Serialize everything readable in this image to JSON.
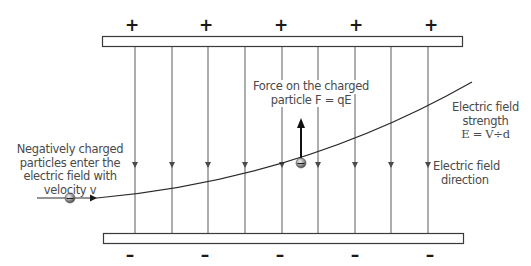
{
  "diagram": {
    "top_plate": {
      "charge_sign": "+",
      "sign_positions_x": [
        132,
        205,
        281,
        355,
        431
      ]
    },
    "bottom_plate": {
      "charge_sign": "–",
      "sign_positions_x": [
        130,
        205,
        280,
        355,
        430
      ]
    },
    "field_line_x": [
      135,
      172,
      208,
      245,
      282,
      318,
      355,
      391,
      428
    ],
    "colors": {
      "stroke": "#3a3a3a",
      "field_line": "#6a6a6a",
      "text": "#4a4a4a",
      "plate_fill": "#ffffff",
      "particle": "#8a8a8a"
    },
    "labels": {
      "entry": {
        "lines": [
          "Negatively charged",
          "particles enter the",
          "electric field with",
          "velocity v"
        ]
      },
      "force": {
        "lines": [
          "Force on the charged",
          "particle F = qE"
        ]
      },
      "strength": {
        "lines": [
          "Electric field",
          "strength",
          "E = V÷d"
        ]
      },
      "direction": {
        "lines": [
          "Electric field",
          "direction"
        ]
      }
    }
  }
}
